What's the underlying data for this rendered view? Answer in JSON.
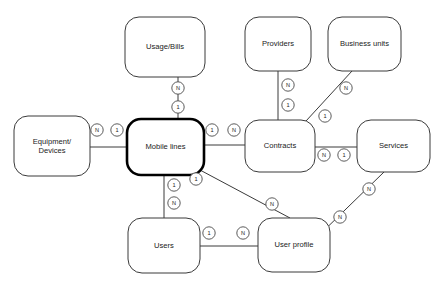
{
  "diagram": {
    "type": "entity-relationship",
    "background_color": "#ffffff",
    "line_color": "#3a3a3a",
    "primary_entity": "Mobile lines"
  },
  "entities": [
    {
      "id": "usage_bills",
      "label": "Usage/Bills",
      "x": 125,
      "y": 17,
      "w": 80,
      "h": 60,
      "primary": false,
      "lines": [
        "Usage/Bills"
      ]
    },
    {
      "id": "providers",
      "label": "Providers",
      "x": 245,
      "y": 17,
      "w": 66,
      "h": 54,
      "primary": false,
      "lines": [
        "Providers"
      ]
    },
    {
      "id": "business_units",
      "label": "Business units",
      "x": 328,
      "y": 17,
      "w": 73,
      "h": 54,
      "primary": false,
      "lines": [
        "Business units"
      ]
    },
    {
      "id": "equipment",
      "label": "Equipment/ Devices",
      "x": 14,
      "y": 116,
      "w": 76,
      "h": 60,
      "primary": false,
      "lines": [
        "Equipment/",
        "Devices"
      ]
    },
    {
      "id": "mobile_lines",
      "label": "Mobile lines",
      "x": 127,
      "y": 119,
      "w": 77,
      "h": 56,
      "primary": true,
      "lines": [
        "Mobile lines"
      ]
    },
    {
      "id": "contracts",
      "label": "Contracts",
      "x": 245,
      "y": 120,
      "w": 70,
      "h": 52,
      "primary": false,
      "lines": [
        "Contracts"
      ]
    },
    {
      "id": "services",
      "label": "Services",
      "x": 357,
      "y": 120,
      "w": 73,
      "h": 52,
      "primary": false,
      "lines": [
        "Services"
      ]
    },
    {
      "id": "users",
      "label": "Users",
      "x": 128,
      "y": 218,
      "w": 72,
      "h": 55,
      "primary": false,
      "lines": [
        "Users"
      ]
    },
    {
      "id": "user_profile",
      "label": "User profile",
      "x": 258,
      "y": 218,
      "w": 72,
      "h": 54,
      "primary": false,
      "lines": [
        "User profile"
      ]
    }
  ],
  "relationships": [
    {
      "id": "rel_usage_mobile",
      "from": "usage_bills",
      "to": "mobile_lines",
      "from_cardinality": "N",
      "to_cardinality": "1",
      "path": [
        [
          178,
          77
        ],
        [
          178,
          119
        ]
      ],
      "from_marker": {
        "x": 178,
        "y": 88,
        "text": "N"
      },
      "to_marker": {
        "x": 178,
        "y": 107,
        "text": "1"
      }
    },
    {
      "id": "rel_equipment_mobile",
      "from": "equipment",
      "to": "mobile_lines",
      "from_cardinality": "N",
      "to_cardinality": "1",
      "path": [
        [
          90,
          147
        ],
        [
          127,
          147
        ]
      ],
      "from_marker": {
        "x": 97,
        "y": 130,
        "text": "N"
      },
      "to_marker": {
        "x": 117,
        "y": 130,
        "text": "1"
      }
    },
    {
      "id": "rel_providers_contracts",
      "from": "providers",
      "to": "contracts",
      "from_cardinality": "N",
      "to_cardinality": "1",
      "path": [
        [
          278,
          71
        ],
        [
          278,
          120
        ]
      ],
      "from_marker": {
        "x": 288,
        "y": 85,
        "text": "N"
      },
      "to_marker": {
        "x": 288,
        "y": 105,
        "text": "1"
      }
    },
    {
      "id": "rel_business_contracts",
      "from": "business_units",
      "to": "contracts",
      "from_cardinality": "N",
      "to_cardinality": "1",
      "path": [
        [
          352,
          71
        ],
        [
          306,
          121
        ]
      ],
      "from_marker": {
        "x": 346,
        "y": 88,
        "text": "N"
      },
      "to_marker": {
        "x": 325,
        "y": 116,
        "text": "1"
      }
    },
    {
      "id": "rel_mobile_contracts",
      "from": "mobile_lines",
      "to": "contracts",
      "from_cardinality": "1",
      "to_cardinality": "N",
      "path": [
        [
          204,
          145
        ],
        [
          245,
          145
        ]
      ],
      "from_marker": {
        "x": 212,
        "y": 130,
        "text": "1"
      },
      "to_marker": {
        "x": 234,
        "y": 130,
        "text": "N"
      }
    },
    {
      "id": "rel_contracts_services",
      "from": "contracts",
      "to": "services",
      "from_cardinality": "N",
      "to_cardinality": "1",
      "path": [
        [
          315,
          147
        ],
        [
          357,
          147
        ]
      ],
      "from_marker": {
        "x": 324,
        "y": 155,
        "text": "N"
      },
      "to_marker": {
        "x": 344,
        "y": 155,
        "text": "1"
      }
    },
    {
      "id": "rel_mobile_users",
      "from": "mobile_lines",
      "to": "users",
      "from_cardinality": "1",
      "to_cardinality": "N",
      "path": [
        [
          164,
          175
        ],
        [
          164,
          218
        ]
      ],
      "from_marker": {
        "x": 174,
        "y": 185,
        "text": "1"
      },
      "to_marker": {
        "x": 174,
        "y": 203,
        "text": "N"
      }
    },
    {
      "id": "rel_mobile_userprofile",
      "from": "mobile_lines",
      "to": "user_profile",
      "from_cardinality": "1",
      "to_cardinality": "N",
      "path": [
        [
          200,
          170
        ],
        [
          290,
          218
        ]
      ],
      "from_marker": {
        "x": 196,
        "y": 179,
        "text": "1"
      },
      "to_marker": {
        "x": 272,
        "y": 204,
        "text": "N"
      }
    },
    {
      "id": "rel_users_userprofile",
      "from": "users",
      "to": "user_profile",
      "from_cardinality": "1",
      "to_cardinality": "N",
      "path": [
        [
          200,
          246
        ],
        [
          258,
          246
        ]
      ],
      "from_marker": {
        "x": 209,
        "y": 233,
        "text": "1"
      },
      "to_marker": {
        "x": 243,
        "y": 233,
        "text": "N"
      }
    },
    {
      "id": "rel_services_userprofile",
      "from": "services",
      "to": "user_profile",
      "from_cardinality": "N",
      "to_cardinality": "N",
      "path": [
        [
          384,
          172
        ],
        [
          308,
          246
        ]
      ],
      "from_marker": {
        "x": 369,
        "y": 189,
        "text": "N"
      },
      "to_marker": {
        "x": 340,
        "y": 217,
        "text": "N"
      }
    }
  ]
}
